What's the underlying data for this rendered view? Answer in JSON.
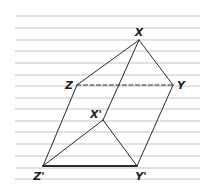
{
  "diagram": {
    "type": "prism-diagram",
    "ruled_lines": {
      "x_start": 15,
      "x_end": 200,
      "y_positions": [
        16,
        28,
        40,
        51,
        63,
        75,
        86,
        98,
        109,
        121,
        132,
        144,
        156,
        168,
        179
      ],
      "color": "#c4c4c4"
    },
    "vertices": {
      "X": {
        "x": 139,
        "y": 40
      },
      "Y": {
        "x": 173,
        "y": 85
      },
      "Z": {
        "x": 77,
        "y": 85
      },
      "X'": {
        "x": 103,
        "y": 120
      },
      "Y'": {
        "x": 137,
        "y": 166
      },
      "Z'": {
        "x": 43,
        "y": 166
      }
    },
    "labels": [
      {
        "text": "X",
        "x": 139,
        "y": 32
      },
      {
        "text": "Y",
        "x": 181,
        "y": 85
      },
      {
        "text": "Z",
        "x": 69,
        "y": 85
      },
      {
        "text": "X'",
        "x": 96,
        "y": 114
      },
      {
        "text": "Y'",
        "x": 141,
        "y": 176
      },
      {
        "text": "Z'",
        "x": 39,
        "y": 176
      }
    ],
    "edges": [
      {
        "from": "X",
        "to": "Z",
        "style": "solid"
      },
      {
        "from": "X",
        "to": "Y",
        "style": "solid"
      },
      {
        "from": "X",
        "to": "X'",
        "style": "solid"
      },
      {
        "from": "Z",
        "to": "Y",
        "style": "dashed"
      },
      {
        "from": "Z",
        "to": "Z'",
        "style": "solid"
      },
      {
        "from": "Y",
        "to": "Y'",
        "style": "solid"
      },
      {
        "from": "X'",
        "to": "Z'",
        "style": "solid"
      },
      {
        "from": "X'",
        "to": "Y'",
        "style": "solid"
      },
      {
        "from": "Z'",
        "to": "Y'",
        "style": "bold"
      }
    ],
    "colors": {
      "edge": "#2a2a2a",
      "label": "#222222",
      "background": "#ffffff"
    }
  }
}
